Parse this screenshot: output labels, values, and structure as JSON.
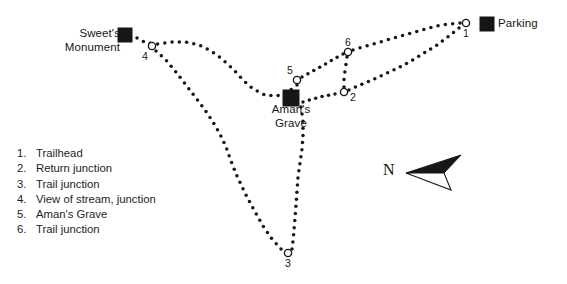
{
  "map": {
    "title": "Trail map with numbered junctions",
    "background_color": "#ffffff",
    "ink_color": "#161616",
    "width": 567,
    "height": 284,
    "site_labels": {
      "sweets_monument": "Sweet's\nMonument",
      "parking": "Parking",
      "amans_grave": "Aman's\nGrave"
    },
    "point_numbers": {
      "p1": "1",
      "p2": "2",
      "p3": "3",
      "p4": "4",
      "p5": "5",
      "p6": "6"
    },
    "markers": [
      {
        "name": "parking-square",
        "type": "filled-square",
        "x": 487,
        "y": 24,
        "size": 15
      },
      {
        "name": "sweets-monument-square",
        "type": "filled-square",
        "x": 125,
        "y": 35,
        "size": 15
      },
      {
        "name": "amans-grave-square",
        "type": "filled-square",
        "x": 291,
        "y": 98,
        "size": 17
      },
      {
        "name": "junction-1",
        "type": "open-circle",
        "x": 466,
        "y": 23,
        "r": 3.6
      },
      {
        "name": "junction-2",
        "type": "open-circle",
        "x": 344,
        "y": 92,
        "r": 3.6
      },
      {
        "name": "junction-3",
        "type": "open-circle",
        "x": 288,
        "y": 253,
        "r": 3.6
      },
      {
        "name": "junction-4",
        "type": "open-circle",
        "x": 152,
        "y": 46,
        "r": 3.6
      },
      {
        "name": "junction-5",
        "type": "open-circle",
        "x": 297,
        "y": 80,
        "r": 3.6
      },
      {
        "name": "junction-6",
        "type": "open-circle",
        "x": 348,
        "y": 52,
        "r": 3.6
      }
    ],
    "trails": [
      {
        "name": "trail-monument-to-grave-north",
        "style": "dotted",
        "path": "M 137 38 L 146 43 L 158 44 L 172 42 L 186 42 L 199 45 L 211 51 L 222 59 L 233 69 L 243 80 L 253 89 L 265 95 L 277 96 L 288 92 L 297 85"
      },
      {
        "name": "trail-junction4-to-junction3-west",
        "style": "dotted",
        "path": "M 156 51 L 166 60 L 176 72 L 186 85 L 196 98 L 205 110 L 213 122 L 220 134 L 226 147 L 231 161 L 237 176 L 245 193 L 254 210 L 263 226 L 272 239 L 281 249"
      },
      {
        "name": "trail-grave-to-junction3-east",
        "style": "dotted",
        "path": "M 301 107 L 303 121 L 303 135 L 302 149 L 300 163 L 298 177 L 297 191 L 296 205 L 295 218 L 294 230 L 293 241 L 292 249"
      },
      {
        "name": "trail-junction5-to-junction6",
        "style": "dotted",
        "path": "M 302 77 L 313 71 L 324 65 L 334 59 L 343 54"
      },
      {
        "name": "trail-junction6-to-junction2",
        "style": "dotted",
        "path": "M 347 57 L 346 64 L 345 71 L 344 79 L 344 87"
      },
      {
        "name": "trail-junction2-to-junction1",
        "style": "dotted",
        "path": "M 349 90 L 360 85 L 372 80 L 385 74 L 398 68 L 411 61 L 424 53 L 437 45 L 449 36 L 459 28"
      },
      {
        "name": "trail-junction6-to-junction1-upper",
        "style": "dotted",
        "path": "M 353 50 L 366 46 L 380 42 L 394 38 L 408 34 L 422 30 L 436 26 L 449 24 L 460 23"
      },
      {
        "name": "trail-amans-grave-to-junction2-stub",
        "style": "dotted",
        "path": "M 303 102 L 313 99 L 324 96 L 335 94"
      }
    ]
  },
  "legend": {
    "name": "map-legend",
    "items": [
      {
        "num": "1.",
        "text": "Trailhead"
      },
      {
        "num": "2.",
        "text": "Return junction"
      },
      {
        "num": "3.",
        "text": "Trail junction"
      },
      {
        "num": "4.",
        "text": "View of stream, junction"
      },
      {
        "num": "5.",
        "text": "Aman's Grave"
      },
      {
        "num": "6.",
        "text": "Trail junction"
      }
    ]
  },
  "compass": {
    "name": "compass-rose",
    "label": "N",
    "direction": "west-northwest"
  }
}
